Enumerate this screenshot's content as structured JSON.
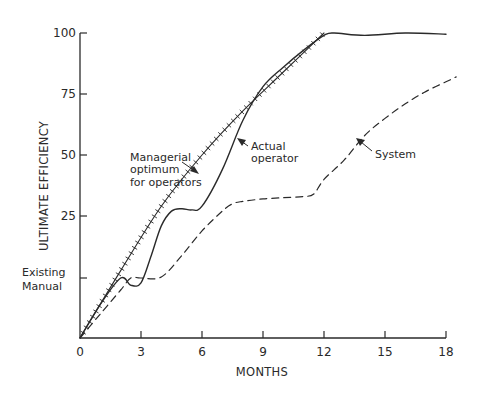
{
  "chart_data": {
    "type": "line",
    "title": "",
    "xlabel": "MONTHS",
    "ylabel": "ULTIMATE EFFICIENCY",
    "xlim": [
      0,
      18
    ],
    "ylim": [
      0,
      100
    ],
    "x_ticks": [
      0,
      3,
      6,
      9,
      12,
      15,
      18
    ],
    "x_tick_labels": [
      "0",
      "3",
      "6",
      "9",
      "12",
      "15",
      "18"
    ],
    "y_ticks": [
      {
        "value": 100,
        "label": "100"
      },
      {
        "value": 75,
        "label": "75"
      },
      {
        "value": 50,
        "label": "50"
      },
      {
        "value": 25,
        "label": "25"
      },
      {
        "value": 12.5,
        "label": "Existing Manual"
      }
    ],
    "y_tick_note": "Lowest tick is labelled 'Existing Manual' (no number); axis is drawn with equal spacing between ticks",
    "origin_label": "0",
    "grid": false,
    "legend": "none (curves labelled inline with arrows)",
    "series": [
      {
        "name": "Managerial optimum for operators",
        "style": "solid line with cross-hatch tick marks",
        "x": [
          0,
          2,
          4,
          6,
          8,
          10,
          12
        ],
        "y": [
          0,
          14,
          29,
          50,
          68,
          84,
          100
        ]
      },
      {
        "name": "Actual operator",
        "style": "solid",
        "x": [
          0,
          1,
          2,
          2.5,
          3,
          3.5,
          4,
          4.5,
          5,
          5.5,
          6,
          7,
          8,
          9,
          10,
          11,
          12,
          12.5,
          14,
          16,
          18
        ],
        "y": [
          0,
          7,
          12.5,
          11,
          11.5,
          17,
          23,
          27,
          28,
          27.5,
          29,
          44,
          64,
          78,
          86,
          93,
          99,
          100,
          99,
          100,
          99.5
        ]
      },
      {
        "name": "System",
        "style": "dashed",
        "x": [
          0,
          1,
          2,
          2.5,
          3,
          4,
          5,
          6,
          7,
          7.5,
          8,
          9,
          10,
          11,
          11.5,
          12,
          13,
          14,
          15,
          16,
          17,
          18,
          18.5
        ],
        "y": [
          0,
          5,
          10,
          12.5,
          12.5,
          12.7,
          17,
          22,
          27,
          30,
          31,
          32,
          32.5,
          33,
          34,
          40,
          48,
          58,
          65,
          71,
          76,
          80,
          82
        ]
      }
    ],
    "annotations": [
      {
        "text": [
          "Managerial",
          "optimum",
          "for operators"
        ],
        "points_to": "Managerial optimum for operators"
      },
      {
        "text": [
          "Actual",
          "operator"
        ],
        "points_to": "Actual operator"
      },
      {
        "text": [
          "System"
        ],
        "points_to": "System"
      },
      {
        "text": [
          "Existing",
          "Manual"
        ],
        "points_to": "y-axis lower tick"
      }
    ]
  },
  "colors": {
    "ink": "#2a2a2a",
    "background": "#ffffff"
  }
}
